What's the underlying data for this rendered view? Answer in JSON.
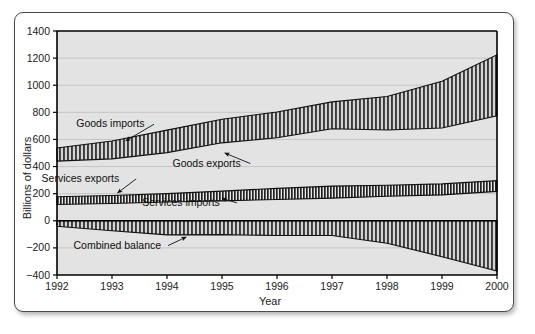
{
  "figure": {
    "background": "#ffffff",
    "plot_background": "#e3e3e3",
    "border_color": "#4a4a4a",
    "axis_color": "#000000",
    "grid_color": "#b9b9b9"
  },
  "chart_data": {
    "type": "area",
    "title": "",
    "xlabel": "Year",
    "ylabel": "Billions of dollars",
    "x": [
      1992,
      1993,
      1994,
      1995,
      1996,
      1997,
      1998,
      1999,
      2000
    ],
    "xticklabels": [
      "1992",
      "1993",
      "1994",
      "1995",
      "1996",
      "1997",
      "1998",
      "1999",
      "2000"
    ],
    "xlim": [
      1992,
      2000
    ],
    "ylim": [
      -400,
      1400
    ],
    "yticks": [
      -400,
      -200,
      0,
      200,
      400,
      600,
      800,
      1000,
      1200,
      1400
    ],
    "yticklabels": [
      "−400",
      "−200",
      "0",
      "200",
      "400",
      "600",
      "800",
      "1000",
      "1200",
      "1400"
    ],
    "grid": true,
    "legend": "none",
    "series": [
      {
        "name": "Goods imports",
        "values": [
          537,
          589,
          669,
          749,
          803,
          877,
          917,
          1030,
          1224
        ]
      },
      {
        "name": "Goods exports",
        "values": [
          440,
          457,
          503,
          575,
          612,
          679,
          670,
          684,
          775
        ]
      },
      {
        "name": "Services exports",
        "values": [
          177,
          186,
          200,
          219,
          239,
          256,
          262,
          272,
          296
        ]
      },
      {
        "name": "Services imports",
        "values": [
          120,
          128,
          138,
          147,
          157,
          167,
          181,
          191,
          217
        ]
      },
      {
        "name": "Combined balance",
        "values": [
          -40,
          -74,
          -104,
          -102,
          -109,
          -109,
          -166,
          -265,
          -370
        ]
      }
    ],
    "bands": [
      {
        "name": "goods-band",
        "upper": "Goods imports",
        "lower": "Goods exports",
        "fill": "hatch-vertical"
      },
      {
        "name": "services-band",
        "upper": "Services exports",
        "lower": "Services imports",
        "fill": "hatch-vertical-dense"
      },
      {
        "name": "balance-band",
        "upper": "zero",
        "lower": "Combined balance",
        "fill": "hatch-vertical"
      }
    ],
    "annotations": [
      {
        "key": "goods_imports",
        "text": "Goods imports",
        "x": 1992.35,
        "y": 690,
        "arrow_to_x": 1993.25,
        "arrow_to_y": 590
      },
      {
        "key": "goods_exports",
        "text": "Goods exports",
        "x": 1994.1,
        "y": 400,
        "arrow_to_x": 1995.05,
        "arrow_to_y": 500
      },
      {
        "key": "services_exports",
        "text": "Services exports",
        "x": 1991.72,
        "y": 287,
        "arrow_to_x": 1993.1,
        "arrow_to_y": 205
      },
      {
        "key": "services_imports",
        "text": "Services imports",
        "x": 1993.55,
        "y": 110,
        "arrow_to_x": 1995.0,
        "arrow_to_y": 165
      },
      {
        "key": "combined_balance",
        "text": "Combined balance",
        "x": 1992.3,
        "y": -205,
        "arrow_to_x": 1994.35,
        "arrow_to_y": -120
      }
    ]
  }
}
